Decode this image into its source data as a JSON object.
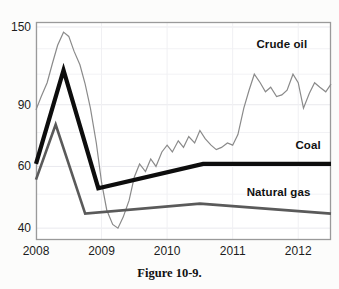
{
  "figure": {
    "caption": "Figure 10-9."
  },
  "chart_data": {
    "type": "line",
    "title": "",
    "xlabel": "",
    "ylabel": "",
    "xlim": [
      2008.0,
      2012.5
    ],
    "ylim": [
      37,
      155
    ],
    "yscale": "log",
    "grid": true,
    "legend_position": "inline-right-labels",
    "xticks": [
      "2008",
      "2009",
      "2010",
      "2011",
      "2012"
    ],
    "xtick_values": [
      2008,
      2009,
      2010,
      2011,
      2012
    ],
    "yticks": [
      "150",
      "90",
      "60",
      "40"
    ],
    "ytick_values": [
      150,
      90,
      60,
      40
    ],
    "series": [
      {
        "name": "Crude oil",
        "color": "#8a8a8a",
        "style": "thin-jagged",
        "x": [
          2008.0,
          2008.08,
          2008.17,
          2008.25,
          2008.33,
          2008.42,
          2008.5,
          2008.58,
          2008.67,
          2008.75,
          2008.83,
          2008.92,
          2009.0,
          2009.08,
          2009.17,
          2009.25,
          2009.33,
          2009.42,
          2009.5,
          2009.58,
          2009.67,
          2009.75,
          2009.83,
          2009.92,
          2010.0,
          2010.08,
          2010.17,
          2010.25,
          2010.33,
          2010.42,
          2010.5,
          2010.58,
          2010.67,
          2010.75,
          2010.83,
          2010.92,
          2011.0,
          2011.08,
          2011.17,
          2011.25,
          2011.33,
          2011.42,
          2011.5,
          2011.58,
          2011.67,
          2011.75,
          2011.83,
          2011.92,
          2012.0,
          2012.08,
          2012.17,
          2012.25,
          2012.33,
          2012.42,
          2012.5
        ],
        "values": [
          87,
          95,
          104,
          118,
          133,
          145,
          141,
          128,
          117,
          103,
          88,
          70,
          54,
          45,
          41,
          40,
          43,
          48,
          56,
          61,
          58,
          63,
          60,
          66,
          69,
          66,
          71,
          68,
          73,
          70,
          76,
          72,
          69,
          67,
          68,
          70,
          69,
          74,
          88,
          99,
          110,
          104,
          98,
          101,
          95,
          96,
          99,
          110,
          104,
          88,
          97,
          104,
          101,
          98,
          103
        ]
      },
      {
        "name": "Coal",
        "color": "#0d0d0d",
        "style": "thick-piecewise",
        "x": [
          2008.0,
          2008.42,
          2008.95,
          2010.55,
          2012.5
        ],
        "values": [
          61,
          113,
          52,
          61,
          61
        ]
      },
      {
        "name": "Natural gas",
        "color": "#5a5a5a",
        "style": "medium-piecewise",
        "x": [
          2008.0,
          2008.3,
          2008.75,
          2010.5,
          2012.5
        ],
        "values": [
          55,
          79,
          44,
          47,
          44
        ]
      }
    ],
    "annotations": [
      {
        "text": "Crude oil",
        "x": 2011.75,
        "y": 132
      },
      {
        "text": "Coal",
        "x": 2012.15,
        "y": 68
      },
      {
        "text": "Natural gas",
        "x": 2011.7,
        "y": 50
      }
    ]
  }
}
